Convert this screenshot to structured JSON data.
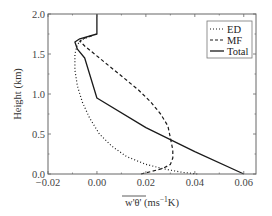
{
  "chart_data": {
    "type": "line",
    "title": "",
    "xlabel": "w'θ' (ms⁻¹K)",
    "xlabel_parts": {
      "overlined": "w'θ'",
      "rest": " (ms",
      "sup": "−1",
      "tail": "K)"
    },
    "ylabel": "Height (km)",
    "xlim": [
      -0.02,
      0.065
    ],
    "ylim": [
      0.0,
      2.0
    ],
    "xticks": [
      -0.02,
      0.0,
      0.02,
      0.04,
      0.06
    ],
    "xtick_labels": [
      "−0.02",
      "0.00",
      "0.02",
      "0.04",
      "0.06"
    ],
    "yticks": [
      0.0,
      0.5,
      1.0,
      1.5,
      2.0
    ],
    "ytick_labels": [
      "0.0",
      "0.5",
      "1.0",
      "1.5",
      "2.0"
    ],
    "grid": false,
    "legend_position": "upper right",
    "series": [
      {
        "name": "ED",
        "style": "dotted",
        "points": [
          [
            0.041,
            0.0
          ],
          [
            0.035,
            0.02
          ],
          [
            0.028,
            0.06
          ],
          [
            0.02,
            0.12
          ],
          [
            0.012,
            0.22
          ],
          [
            0.006,
            0.35
          ],
          [
            0.001,
            0.5
          ],
          [
            -0.003,
            0.7
          ],
          [
            -0.006,
            0.9
          ],
          [
            -0.008,
            1.1
          ],
          [
            -0.009,
            1.3
          ],
          [
            -0.009,
            1.5
          ],
          [
            -0.008,
            1.62
          ],
          [
            -0.006,
            1.68
          ],
          [
            -0.003,
            1.72
          ]
        ]
      },
      {
        "name": "MF",
        "style": "dashed",
        "points": [
          [
            0.018,
            0.0
          ],
          [
            0.022,
            0.03
          ],
          [
            0.027,
            0.07
          ],
          [
            0.03,
            0.12
          ],
          [
            0.031,
            0.2
          ],
          [
            0.031,
            0.3
          ],
          [
            0.03,
            0.45
          ],
          [
            0.029,
            0.6
          ],
          [
            0.026,
            0.75
          ],
          [
            0.022,
            0.9
          ],
          [
            0.017,
            1.05
          ],
          [
            0.011,
            1.2
          ],
          [
            0.005,
            1.35
          ],
          [
            -0.001,
            1.5
          ],
          [
            -0.005,
            1.6
          ],
          [
            -0.007,
            1.66
          ],
          [
            -0.005,
            1.7
          ],
          [
            -0.002,
            1.73
          ]
        ]
      },
      {
        "name": "Total",
        "style": "solid",
        "points": [
          [
            0.06,
            0.0
          ],
          [
            0.04,
            0.28
          ],
          [
            0.02,
            0.58
          ],
          [
            0.0,
            0.95
          ],
          [
            -0.005,
            1.45
          ],
          [
            -0.008,
            1.56
          ],
          [
            -0.009,
            1.65
          ],
          [
            -0.007,
            1.69
          ],
          [
            0.0,
            1.75
          ],
          [
            0.0,
            2.0
          ]
        ]
      }
    ]
  },
  "legend": {
    "items": [
      {
        "label": "ED",
        "style": "dotted"
      },
      {
        "label": "MF",
        "style": "dashed"
      },
      {
        "label": "Total",
        "style": "solid"
      }
    ]
  },
  "colors": {
    "line": "#1a1a1a",
    "axis": "#555555",
    "background": "#ffffff"
  }
}
